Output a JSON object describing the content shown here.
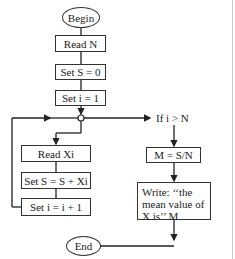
{
  "flowchart": {
    "start": "Begin",
    "end": "End",
    "steps": {
      "read_n": "Read N",
      "set_s": "Set S = 0",
      "set_i": "Set i = 1",
      "read_xi": "Read Xi",
      "accumulate": "Set S = S + Xi",
      "increment": "Set i = i + 1",
      "compute_mean": "M = S/N",
      "write_line1": "Write: ‘‘the",
      "write_line2": "mean value of",
      "write_line3": "X is’’ M"
    },
    "decision": "If i > N"
  }
}
